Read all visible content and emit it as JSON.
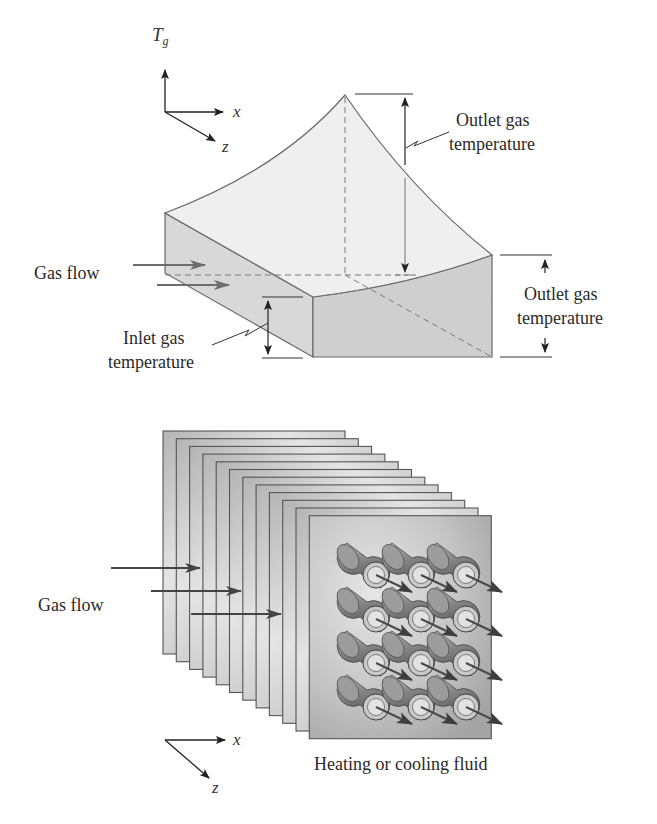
{
  "top_diagram": {
    "axes": {
      "vertical": "T",
      "vertical_subscript": "g",
      "x": "x",
      "z": "z"
    },
    "labels": {
      "gas_flow": "Gas flow",
      "outlet_peak_line1": "Outlet gas",
      "outlet_peak_line2": "temperature",
      "outlet_side_line1": "Outlet gas",
      "outlet_side_line2": "temperature",
      "inlet_line1": "Inlet gas",
      "inlet_line2": "temperature"
    },
    "colors": {
      "top_surface": "#ededed",
      "side_face": "#d6d6d6",
      "front_face": "#cfcfcf",
      "edge": "#6a6a6a",
      "flow_arrow": "#6d6d6d"
    }
  },
  "bottom_diagram": {
    "axes": {
      "x": "x",
      "z": "z"
    },
    "labels": {
      "gas_flow": "Gas flow",
      "fluid": "Heating or cooling fluid"
    },
    "plate_count": 12,
    "tube_grid": {
      "columns": 3,
      "rows": 4
    },
    "colors": {
      "plate_light": "#e2e2e2",
      "plate_dark": "#a9a9a9",
      "plate_edge": "#555555",
      "tube": "#9a9a9a",
      "arrow": "#4a4a4a"
    }
  }
}
